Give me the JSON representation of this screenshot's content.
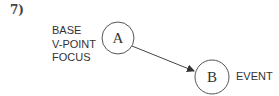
{
  "figure": {
    "number_label": "7)",
    "node_a": {
      "label": "A",
      "annotations": [
        "BASE",
        "V-POINT",
        "FOCUS"
      ]
    },
    "node_b": {
      "label": "B",
      "annotation": "EVENT"
    },
    "edge": {
      "from": "A",
      "to": "B",
      "directed": true
    }
  }
}
